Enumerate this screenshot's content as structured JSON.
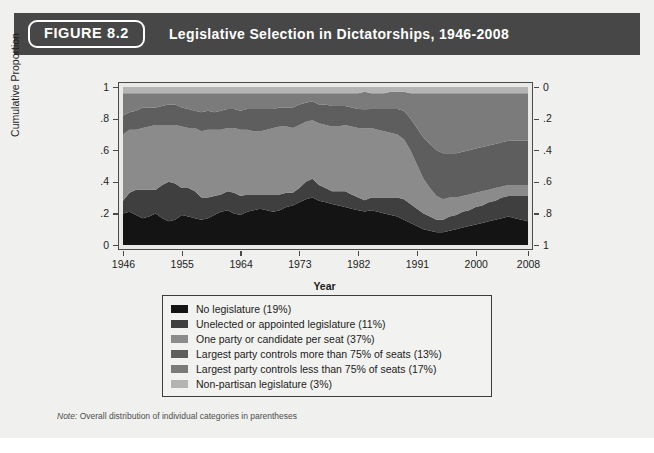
{
  "figure": {
    "badge": "FIGURE 8.2",
    "title": "Legislative Selection in Dictatorships, 1946-2008",
    "note_prefix": "Note:",
    "note_text": " Overall distribution of individual categories in parentheses"
  },
  "colors": {
    "header_bar": "#474747",
    "card_bg": "#f0f0ee",
    "plot_bg": "#e9e9e7",
    "axis": "#4a4a4a",
    "series": [
      "#141414",
      "#3f3f3f",
      "#8b8b8b",
      "#5e5e5e",
      "#7b7b7b",
      "#b4b4b4"
    ]
  },
  "legend": {
    "items": [
      {
        "label": "No legislature (19%)",
        "color": "#141414"
      },
      {
        "label": "Unelected or appointed legislature (11%)",
        "color": "#3f3f3f"
      },
      {
        "label": "One party or candidate per seat (37%)",
        "color": "#8b8b8b"
      },
      {
        "label": "Largest party controls more than 75% of seats (13%)",
        "color": "#5e5e5e"
      },
      {
        "label": "Largest party controls less than 75% of seats (17%)",
        "color": "#7b7b7b"
      },
      {
        "label": "Non-partisan legislature (3%)",
        "color": "#b4b4b4"
      }
    ]
  },
  "chart_data": {
    "type": "area",
    "title": "Legislative Selection in Dictatorships, 1946-2008",
    "xlabel": "Year",
    "ylabel": "Cumulative Proportion",
    "y2label": "",
    "xlim": [
      1946,
      2008
    ],
    "ylim": [
      0,
      1
    ],
    "y2lim": [
      1,
      0
    ],
    "grid": false,
    "legend_position": "below-plot",
    "xticks": [
      1946,
      1955,
      1964,
      1973,
      1982,
      1991,
      2000,
      2008
    ],
    "xticklabels": [
      "1946",
      "1955",
      "1964",
      "1973",
      "1982",
      "1991",
      "2000",
      "2008"
    ],
    "yticks": [
      0,
      0.2,
      0.4,
      0.6,
      0.8,
      1
    ],
    "yticklabels": [
      "0",
      ".2",
      ".4",
      ".6",
      ".8",
      "1"
    ],
    "y2ticks": [
      0,
      0.2,
      0.4,
      0.6,
      0.8,
      1
    ],
    "y2ticklabels": [
      "0",
      ".2",
      ".4",
      ".6",
      ".8",
      "1"
    ],
    "stacked": true,
    "x": [
      1946,
      1947,
      1948,
      1949,
      1950,
      1951,
      1952,
      1953,
      1954,
      1955,
      1956,
      1957,
      1958,
      1959,
      1960,
      1961,
      1962,
      1963,
      1964,
      1965,
      1966,
      1967,
      1968,
      1969,
      1970,
      1971,
      1972,
      1973,
      1974,
      1975,
      1976,
      1977,
      1978,
      1979,
      1980,
      1981,
      1982,
      1983,
      1984,
      1985,
      1986,
      1987,
      1988,
      1989,
      1990,
      1991,
      1992,
      1993,
      1994,
      1995,
      1996,
      1997,
      1998,
      1999,
      2000,
      2001,
      2002,
      2003,
      2004,
      2005,
      2006,
      2007,
      2008
    ],
    "series": [
      {
        "name": "No legislature (19%)",
        "color": "#141414",
        "overall_share": 0.19,
        "values": [
          0.2,
          0.21,
          0.19,
          0.17,
          0.18,
          0.2,
          0.17,
          0.15,
          0.16,
          0.19,
          0.18,
          0.17,
          0.16,
          0.17,
          0.19,
          0.21,
          0.22,
          0.2,
          0.19,
          0.21,
          0.22,
          0.23,
          0.22,
          0.21,
          0.22,
          0.24,
          0.25,
          0.27,
          0.29,
          0.3,
          0.28,
          0.27,
          0.26,
          0.25,
          0.24,
          0.23,
          0.22,
          0.21,
          0.22,
          0.21,
          0.2,
          0.19,
          0.18,
          0.16,
          0.14,
          0.12,
          0.1,
          0.09,
          0.08,
          0.08,
          0.09,
          0.1,
          0.11,
          0.12,
          0.13,
          0.14,
          0.15,
          0.16,
          0.17,
          0.18,
          0.17,
          0.16,
          0.15
        ]
      },
      {
        "name": "Unelected or appointed legislature (11%)",
        "color": "#3f3f3f",
        "overall_share": 0.11,
        "values": [
          0.08,
          0.12,
          0.16,
          0.18,
          0.17,
          0.15,
          0.21,
          0.25,
          0.23,
          0.17,
          0.18,
          0.17,
          0.14,
          0.13,
          0.12,
          0.11,
          0.12,
          0.13,
          0.12,
          0.11,
          0.1,
          0.09,
          0.1,
          0.11,
          0.1,
          0.09,
          0.08,
          0.09,
          0.11,
          0.12,
          0.1,
          0.09,
          0.08,
          0.09,
          0.1,
          0.09,
          0.08,
          0.07,
          0.08,
          0.09,
          0.1,
          0.11,
          0.12,
          0.13,
          0.12,
          0.11,
          0.1,
          0.09,
          0.08,
          0.08,
          0.09,
          0.09,
          0.1,
          0.1,
          0.11,
          0.11,
          0.12,
          0.12,
          0.13,
          0.13,
          0.14,
          0.15,
          0.16
        ]
      },
      {
        "name": "One party or candidate per seat (37%)",
        "color": "#8b8b8b",
        "overall_share": 0.37,
        "values": [
          0.42,
          0.4,
          0.38,
          0.39,
          0.4,
          0.41,
          0.38,
          0.36,
          0.37,
          0.39,
          0.38,
          0.4,
          0.42,
          0.43,
          0.42,
          0.41,
          0.4,
          0.41,
          0.42,
          0.41,
          0.4,
          0.4,
          0.41,
          0.42,
          0.43,
          0.42,
          0.41,
          0.4,
          0.38,
          0.37,
          0.39,
          0.4,
          0.41,
          0.41,
          0.42,
          0.43,
          0.44,
          0.45,
          0.44,
          0.43,
          0.42,
          0.41,
          0.4,
          0.38,
          0.34,
          0.28,
          0.22,
          0.18,
          0.15,
          0.13,
          0.12,
          0.11,
          0.1,
          0.1,
          0.09,
          0.09,
          0.08,
          0.08,
          0.07,
          0.07,
          0.07,
          0.07,
          0.07
        ]
      },
      {
        "name": "Largest party controls more than 75% of seats (13%)",
        "color": "#5e5e5e",
        "overall_share": 0.13,
        "values": [
          0.12,
          0.11,
          0.12,
          0.13,
          0.12,
          0.11,
          0.12,
          0.13,
          0.13,
          0.12,
          0.12,
          0.11,
          0.12,
          0.12,
          0.11,
          0.12,
          0.12,
          0.12,
          0.12,
          0.13,
          0.14,
          0.14,
          0.13,
          0.12,
          0.12,
          0.12,
          0.13,
          0.13,
          0.12,
          0.12,
          0.12,
          0.13,
          0.13,
          0.13,
          0.12,
          0.12,
          0.12,
          0.12,
          0.12,
          0.13,
          0.14,
          0.15,
          0.16,
          0.18,
          0.2,
          0.23,
          0.26,
          0.28,
          0.29,
          0.29,
          0.28,
          0.28,
          0.28,
          0.28,
          0.28,
          0.28,
          0.28,
          0.28,
          0.28,
          0.28,
          0.28,
          0.28,
          0.28
        ]
      },
      {
        "name": "Largest party controls less than 75% of seats (17%)",
        "color": "#7b7b7b",
        "overall_share": 0.17,
        "values": [
          0.14,
          0.12,
          0.11,
          0.09,
          0.09,
          0.09,
          0.08,
          0.07,
          0.07,
          0.09,
          0.1,
          0.11,
          0.12,
          0.11,
          0.12,
          0.11,
          0.1,
          0.1,
          0.11,
          0.1,
          0.1,
          0.1,
          0.1,
          0.1,
          0.09,
          0.09,
          0.09,
          0.07,
          0.06,
          0.05,
          0.07,
          0.07,
          0.08,
          0.08,
          0.08,
          0.09,
          0.1,
          0.11,
          0.1,
          0.1,
          0.1,
          0.11,
          0.11,
          0.12,
          0.16,
          0.22,
          0.28,
          0.32,
          0.36,
          0.38,
          0.38,
          0.38,
          0.37,
          0.36,
          0.35,
          0.34,
          0.33,
          0.32,
          0.31,
          0.3,
          0.3,
          0.3,
          0.3
        ]
      },
      {
        "name": "Non-partisan legislature (3%)",
        "color": "#b4b4b4",
        "overall_share": 0.03,
        "values": [
          0.04,
          0.04,
          0.04,
          0.04,
          0.04,
          0.04,
          0.04,
          0.04,
          0.04,
          0.04,
          0.04,
          0.04,
          0.04,
          0.04,
          0.04,
          0.04,
          0.04,
          0.04,
          0.04,
          0.04,
          0.04,
          0.04,
          0.04,
          0.04,
          0.04,
          0.04,
          0.04,
          0.04,
          0.04,
          0.04,
          0.04,
          0.04,
          0.04,
          0.04,
          0.04,
          0.04,
          0.04,
          0.03,
          0.04,
          0.04,
          0.04,
          0.03,
          0.03,
          0.03,
          0.04,
          0.04,
          0.04,
          0.04,
          0.04,
          0.04,
          0.04,
          0.04,
          0.04,
          0.04,
          0.04,
          0.04,
          0.04,
          0.04,
          0.04,
          0.04,
          0.04,
          0.04,
          0.04
        ]
      }
    ]
  }
}
